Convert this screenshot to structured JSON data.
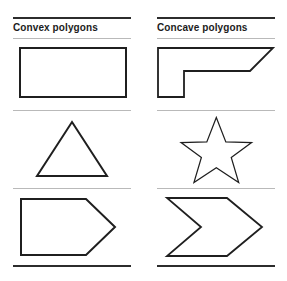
{
  "figure": {
    "background_color": "#ffffff",
    "stroke_color": "#1f1f1f",
    "rule_thick_color": "#2c2c2c",
    "rule_thin_color": "#b9b9b9"
  },
  "columns": [
    {
      "id": "convex",
      "title": "Convex polygons",
      "shapes": [
        {
          "name": "rectangle",
          "label": "rectangle",
          "points": "12,6 118,6 118,55 12,55"
        },
        {
          "name": "triangle",
          "label": "triangle",
          "points": "64,10 99,64 29,64"
        },
        {
          "name": "pentagon",
          "label": "home-plate pentagon",
          "points": "13,9 78,9 107,37 78,65 13,65"
        }
      ]
    },
    {
      "id": "concave",
      "title": "Concave polygons",
      "shapes": [
        {
          "name": "notched-arrow",
          "label": "notched arrow polygon",
          "points": "6,6 121,6 98,29 32,29 32,55 6,55"
        },
        {
          "name": "star",
          "label": "five-pointed star",
          "points": "64,8 78,44 116,45 86,67 97,104 64,82 31,104 42,67 12,45 50,44"
        },
        {
          "name": "chevron",
          "label": "chevron arrow",
          "points": "15,8 75,8 110,37 75,66 15,66 49,37"
        }
      ]
    }
  ]
}
